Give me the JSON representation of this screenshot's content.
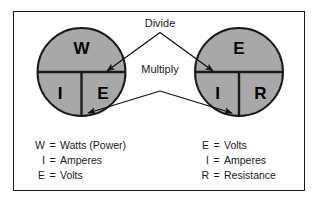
{
  "diagram": {
    "colors": {
      "circle_fill": "#a8a8a8",
      "stroke": "#1a1a1a",
      "background": "#ffffff",
      "text": "#1a1a1a"
    },
    "operations": {
      "divide_label": "Divide",
      "multiply_label": "Multiply"
    },
    "wheels": [
      {
        "name": "power-wheel",
        "top_letter": "W",
        "bottom_left_letter": "I",
        "bottom_right_letter": "E"
      },
      {
        "name": "ohms-law-wheel",
        "top_letter": "E",
        "bottom_left_letter": "I",
        "bottom_right_letter": "R"
      }
    ],
    "legend_left": {
      "name": "power-legend",
      "rows": [
        {
          "symbol": "W",
          "equals": "=",
          "definition": "Watts (Power)"
        },
        {
          "symbol": "I",
          "equals": "=",
          "definition": "Amperes"
        },
        {
          "symbol": "E",
          "equals": "=",
          "definition": "Volts"
        }
      ]
    },
    "legend_right": {
      "name": "ohms-law-legend",
      "rows": [
        {
          "symbol": "E",
          "equals": "=",
          "definition": "Volts"
        },
        {
          "symbol": "I",
          "equals": "=",
          "definition": "Amperes"
        },
        {
          "symbol": "R",
          "equals": "=",
          "definition": "Resistance"
        }
      ]
    }
  }
}
